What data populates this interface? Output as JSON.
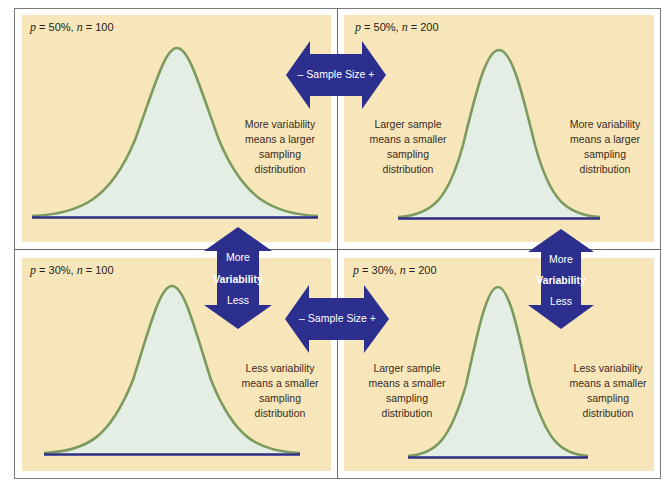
{
  "colors": {
    "panel_bg": "#f7e6b9",
    "curve_stroke": "#7c9a5e",
    "curve_fill": "#e4eee4",
    "baseline": "#2e2e8c",
    "arrow": "#2d2f8e",
    "arrow_text": "#ffffff",
    "divider": "#6a6a6a"
  },
  "panels": [
    {
      "id": "top-left",
      "label_p": "p",
      "label_p_value": " = 50%, ",
      "label_n": "n",
      "label_n_value": " = 100",
      "notes": [
        {
          "text_lines": [
            "More variability",
            "means a larger",
            "sampling",
            "distribution"
          ]
        }
      ]
    },
    {
      "id": "top-right",
      "label_p": "p",
      "label_p_value": " = 50%, ",
      "label_n": "n",
      "label_n_value": " = 200",
      "notes": [
        {
          "text_lines": [
            "Larger sample",
            "means a smaller",
            "sampling",
            "distribution"
          ]
        },
        {
          "text_lines": [
            "More variability",
            "means a larger",
            "sampling",
            "distribution"
          ]
        }
      ]
    },
    {
      "id": "bottom-left",
      "label_p": "p",
      "label_p_value": " = 30%, ",
      "label_n": "n",
      "label_n_value": " = 100",
      "notes": [
        {
          "text_lines": [
            "Less variability",
            "means a smaller",
            "sampling",
            "distribution"
          ]
        }
      ]
    },
    {
      "id": "bottom-right",
      "label_p": "p",
      "label_p_value": " = 30%, ",
      "label_n": "n",
      "label_n_value": " = 200",
      "notes": [
        {
          "text_lines": [
            "Larger sample",
            "means a smaller",
            "sampling",
            "distribution"
          ]
        },
        {
          "text_lines": [
            "Less variability",
            "means a smaller",
            "sampling",
            "distribution"
          ]
        }
      ]
    }
  ],
  "arrows": {
    "sample_size_label": "– Sample Size +",
    "variability_top": "More",
    "variability_mid": "Variability",
    "variability_bottom": "Less"
  }
}
